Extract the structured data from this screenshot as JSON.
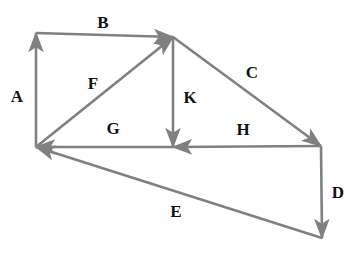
{
  "figure": {
    "type": "vector-diagram",
    "title": "",
    "background_color": "#ffffff",
    "stroke_color": "#808080",
    "label_color": "#121212",
    "stroke_width": 2.6,
    "width": 358,
    "height": 259
  },
  "points": {
    "origin_bottom_left": {
      "x": 36,
      "y": 147
    },
    "top_left": {
      "x": 36,
      "y": 33
    },
    "apex_top_right": {
      "x": 173,
      "y": 37
    },
    "mid_bottom": {
      "x": 173,
      "y": 147
    },
    "right_corner": {
      "x": 321,
      "y": 146
    },
    "bottom_right": {
      "x": 322,
      "y": 238
    }
  },
  "vectors": [
    {
      "name": "A",
      "label": "A",
      "description": "upward vertical vector on the left side",
      "from": {
        "x": 36,
        "y": 147
      },
      "to": {
        "x": 36,
        "y": 33
      },
      "arrow_at": "to",
      "label_pos": {
        "x": 17,
        "y": 96
      }
    },
    {
      "name": "B",
      "label": "B",
      "description": "rightward horizontal vector along the top",
      "from": {
        "x": 36,
        "y": 33
      },
      "to": {
        "x": 173,
        "y": 37
      },
      "arrow_at": "to",
      "label_pos": {
        "x": 103,
        "y": 22
      }
    },
    {
      "name": "C",
      "label": "C",
      "description": "down-right diagonal vector from apex to right corner",
      "from": {
        "x": 173,
        "y": 37
      },
      "to": {
        "x": 321,
        "y": 146
      },
      "arrow_at": "to",
      "label_pos": {
        "x": 252,
        "y": 72
      }
    },
    {
      "name": "D",
      "label": "D",
      "description": "downward vertical vector on the right side",
      "from": {
        "x": 321,
        "y": 146
      },
      "to": {
        "x": 322,
        "y": 238
      },
      "arrow_at": "to",
      "label_pos": {
        "x": 338,
        "y": 192
      }
    },
    {
      "name": "E",
      "label": "E",
      "description": "up-left diagonal vector from bottom right back to origin",
      "from": {
        "x": 322,
        "y": 238
      },
      "to": {
        "x": 36,
        "y": 147
      },
      "arrow_at": "to",
      "label_pos": {
        "x": 176,
        "y": 211
      }
    },
    {
      "name": "F",
      "label": "F",
      "description": "up-right diagonal vector from origin to apex",
      "from": {
        "x": 36,
        "y": 147
      },
      "to": {
        "x": 173,
        "y": 37
      },
      "arrow_at": "to",
      "label_pos": {
        "x": 93,
        "y": 83
      }
    },
    {
      "name": "G",
      "label": "G",
      "description": "leftward horizontal vector from mid bottom to origin",
      "from": {
        "x": 173,
        "y": 147
      },
      "to": {
        "x": 36,
        "y": 147
      },
      "arrow_at": "to",
      "label_pos": {
        "x": 113,
        "y": 128
      }
    },
    {
      "name": "H",
      "label": "H",
      "description": "leftward horizontal vector from right corner to mid bottom",
      "from": {
        "x": 321,
        "y": 146
      },
      "to": {
        "x": 173,
        "y": 147
      },
      "arrow_at": "to",
      "label_pos": {
        "x": 243,
        "y": 129
      }
    },
    {
      "name": "K",
      "label": "K",
      "description": "downward vertical vector from apex to mid bottom",
      "from": {
        "x": 173,
        "y": 37
      },
      "to": {
        "x": 173,
        "y": 147
      },
      "arrow_at": "to",
      "label_pos": {
        "x": 190,
        "y": 97
      }
    }
  ]
}
